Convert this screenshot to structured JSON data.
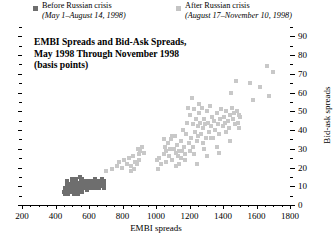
{
  "chart_data": {
    "type": "scatter",
    "title": "EMBI Spreads and Bid-Ask Spreads, May 1998 Through November 1998 (basis points)",
    "title_lines": [
      "EMBI Spreads and Bid-Ask Spreads,",
      "May 1998 Through November 1998",
      "(basis points)"
    ],
    "xlabel": "EMBI spreads",
    "ylabel": "Bid-ask spreads",
    "xlim": [
      200,
      1800
    ],
    "ylim": [
      0,
      95
    ],
    "xticks": [
      200,
      400,
      600,
      800,
      1000,
      1200,
      1400,
      1600,
      1800
    ],
    "yticks": [
      0,
      10,
      20,
      30,
      40,
      50,
      60,
      70,
      80,
      90
    ],
    "x_minor_step": 50,
    "y_minor_step": 5,
    "grid": false,
    "legend_position": "top",
    "colors": {
      "before": "#6e6e6e",
      "after": "#c8c8c8",
      "axis": "#000000",
      "background": "#ffffff"
    },
    "series": [
      {
        "name": "Before Russian crisis",
        "sublabel": "(May 1–August 14, 1998)",
        "marker": "square",
        "color": "#6e6e6e",
        "points": [
          [
            452,
            7
          ],
          [
            458,
            6
          ],
          [
            463,
            8
          ],
          [
            468,
            7
          ],
          [
            470,
            9
          ],
          [
            474,
            6
          ],
          [
            478,
            8
          ],
          [
            482,
            7
          ],
          [
            486,
            9
          ],
          [
            490,
            8
          ],
          [
            494,
            7
          ],
          [
            498,
            10
          ],
          [
            502,
            8
          ],
          [
            506,
            9
          ],
          [
            510,
            7
          ],
          [
            512,
            10
          ],
          [
            516,
            8
          ],
          [
            520,
            9
          ],
          [
            524,
            11
          ],
          [
            528,
            8
          ],
          [
            530,
            10
          ],
          [
            534,
            9
          ],
          [
            538,
            12
          ],
          [
            540,
            8
          ],
          [
            544,
            10
          ],
          [
            548,
            9
          ],
          [
            550,
            13
          ],
          [
            554,
            10
          ],
          [
            556,
            8
          ],
          [
            560,
            11
          ],
          [
            562,
            9
          ],
          [
            566,
            10
          ],
          [
            570,
            12
          ],
          [
            572,
            9
          ],
          [
            576,
            11
          ],
          [
            580,
            10
          ],
          [
            584,
            13
          ],
          [
            586,
            9
          ],
          [
            590,
            11
          ],
          [
            594,
            10
          ],
          [
            598,
            12
          ],
          [
            600,
            9
          ],
          [
            604,
            11
          ],
          [
            608,
            10
          ],
          [
            610,
            13
          ],
          [
            614,
            11
          ],
          [
            618,
            10
          ],
          [
            620,
            12
          ],
          [
            624,
            11
          ],
          [
            628,
            10
          ],
          [
            632,
            12
          ],
          [
            636,
            11
          ],
          [
            640,
            10
          ],
          [
            644,
            12
          ],
          [
            648,
            11
          ],
          [
            652,
            12
          ],
          [
            656,
            11
          ],
          [
            660,
            12
          ],
          [
            664,
            11
          ],
          [
            668,
            12
          ],
          [
            672,
            11
          ],
          [
            676,
            12
          ],
          [
            680,
            11
          ],
          [
            684,
            12
          ],
          [
            688,
            12
          ],
          [
            692,
            11
          ],
          [
            520,
            14
          ],
          [
            548,
            15
          ],
          [
            576,
            13
          ],
          [
            496,
            12
          ],
          [
            466,
            11
          ],
          [
            480,
            11
          ],
          [
            508,
            6
          ],
          [
            534,
            6
          ],
          [
            560,
            7
          ],
          [
            588,
            8
          ],
          [
            616,
            9
          ],
          [
            644,
            9
          ],
          [
            470,
            13
          ],
          [
            500,
            14
          ],
          [
            530,
            12
          ],
          [
            604,
            13
          ],
          [
            628,
            13
          ],
          [
            656,
            13
          ],
          [
            662,
            9
          ],
          [
            684,
            10
          ],
          [
            690,
            13
          ],
          [
            455,
            9
          ],
          [
            476,
            10
          ],
          [
            492,
            9
          ],
          [
            512,
            12
          ],
          [
            542,
            11
          ],
          [
            568,
            12
          ],
          [
            596,
            11
          ],
          [
            622,
            12
          ],
          [
            650,
            11
          ],
          [
            676,
            10
          ],
          [
            688,
            9
          ],
          [
            560,
            14
          ],
          [
            600,
            10
          ],
          [
            636,
            14
          ],
          [
            680,
            14
          ]
        ]
      },
      {
        "name": "After Russian crisis",
        "sublabel": "(August 17–November 10, 1998)",
        "marker": "square",
        "color": "#c8c8c8",
        "points": [
          [
            700,
            18
          ],
          [
            735,
            19
          ],
          [
            768,
            21
          ],
          [
            782,
            23
          ],
          [
            795,
            20
          ],
          [
            810,
            24
          ],
          [
            824,
            22
          ],
          [
            836,
            25
          ],
          [
            848,
            21
          ],
          [
            860,
            26
          ],
          [
            872,
            23
          ],
          [
            884,
            22
          ],
          [
            896,
            27
          ],
          [
            900,
            24
          ],
          [
            890,
            30
          ],
          [
            905,
            29
          ],
          [
            918,
            31
          ],
          [
            870,
            19
          ],
          [
            850,
            18
          ],
          [
            1010,
            19
          ],
          [
            1020,
            25
          ],
          [
            1030,
            22
          ],
          [
            1045,
            27
          ],
          [
            1055,
            31
          ],
          [
            1062,
            29
          ],
          [
            1070,
            33
          ],
          [
            1080,
            26
          ],
          [
            1090,
            35
          ],
          [
            1098,
            24
          ],
          [
            1105,
            30
          ],
          [
            1112,
            37
          ],
          [
            1118,
            28
          ],
          [
            1125,
            32
          ],
          [
            1132,
            26
          ],
          [
            1140,
            22
          ],
          [
            1148,
            34
          ],
          [
            1155,
            29
          ],
          [
            1162,
            40
          ],
          [
            1168,
            31
          ],
          [
            1175,
            27
          ],
          [
            1182,
            38
          ],
          [
            1188,
            44
          ],
          [
            1195,
            33
          ],
          [
            1200,
            29
          ],
          [
            1205,
            48
          ],
          [
            1210,
            36
          ],
          [
            1215,
            57
          ],
          [
            1218,
            43
          ],
          [
            1222,
            31
          ],
          [
            1228,
            51
          ],
          [
            1232,
            39
          ],
          [
            1238,
            46
          ],
          [
            1242,
            34
          ],
          [
            1248,
            42
          ],
          [
            1252,
            37
          ],
          [
            1258,
            49
          ],
          [
            1262,
            44
          ],
          [
            1268,
            38
          ],
          [
            1272,
            52
          ],
          [
            1278,
            41
          ],
          [
            1282,
            33
          ],
          [
            1288,
            46
          ],
          [
            1292,
            43
          ],
          [
            1298,
            36
          ],
          [
            1305,
            50
          ],
          [
            1310,
            44
          ],
          [
            1318,
            39
          ],
          [
            1322,
            53
          ],
          [
            1328,
            42
          ],
          [
            1335,
            47
          ],
          [
            1342,
            36
          ],
          [
            1348,
            45
          ],
          [
            1355,
            40
          ],
          [
            1362,
            49
          ],
          [
            1368,
            43
          ],
          [
            1375,
            38
          ],
          [
            1382,
            46
          ],
          [
            1390,
            51
          ],
          [
            1398,
            42
          ],
          [
            1405,
            47
          ],
          [
            1412,
            44
          ],
          [
            1420,
            50
          ],
          [
            1428,
            45
          ],
          [
            1435,
            41
          ],
          [
            1442,
            48
          ],
          [
            1450,
            60
          ],
          [
            1455,
            52
          ],
          [
            1462,
            46
          ],
          [
            1468,
            49
          ],
          [
            1475,
            66
          ],
          [
            1482,
            50
          ],
          [
            1488,
            44
          ],
          [
            1495,
            48
          ],
          [
            1500,
            47
          ],
          [
            1560,
            65
          ],
          [
            1580,
            56
          ],
          [
            1620,
            63
          ],
          [
            1660,
            74
          ],
          [
            1672,
            58
          ],
          [
            1700,
            71
          ],
          [
            1082,
            30
          ],
          [
            1135,
            29
          ],
          [
            1190,
            52
          ],
          [
            1255,
            54
          ],
          [
            1330,
            36
          ],
          [
            1415,
            39
          ],
          [
            1470,
            43
          ],
          [
            1045,
            35
          ],
          [
            1098,
            37
          ],
          [
            1152,
            25
          ],
          [
            1225,
            27
          ],
          [
            1285,
            30
          ],
          [
            1365,
            31
          ],
          [
            1440,
            34
          ],
          [
            1498,
            41
          ],
          [
            930,
            28
          ],
          [
            1008,
            24
          ],
          [
            1060,
            23
          ],
          [
            1118,
            21
          ],
          [
            1172,
            24
          ],
          [
            1242,
            22
          ],
          [
            1302,
            26
          ],
          [
            1378,
            28
          ]
        ]
      }
    ]
  },
  "legend": {
    "before": {
      "label": "Before Russian crisis",
      "period": "(May 1–August 14, 1998)"
    },
    "after": {
      "label": "After Russian crisis",
      "period": "(August 17–November 10, 1998)"
    }
  }
}
